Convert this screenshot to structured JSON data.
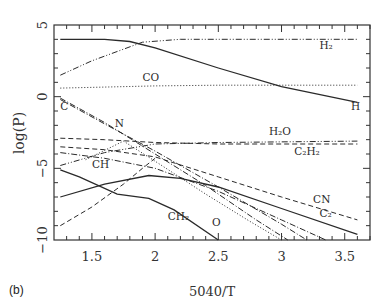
{
  "panel_label": "(b)",
  "chart_data": {
    "type": "line",
    "title": "",
    "xlabel": "5040/T",
    "ylabel": "log(P)",
    "xlim": [
      1.2,
      3.7
    ],
    "ylim": [
      -10,
      5
    ],
    "xticks": [
      1.5,
      2,
      2.5,
      3,
      3.5
    ],
    "xtick_labels": [
      "1.5",
      "2",
      "2.5",
      "3",
      "3.5"
    ],
    "yticks": [
      5,
      0,
      -5,
      -10
    ],
    "ytick_labels": [
      "5",
      "0",
      "−5",
      "−10"
    ],
    "grid": false,
    "legend": "inline labels",
    "series": [
      {
        "name": "H",
        "style": "solid",
        "label_pos": [
          3.55,
          -0.9
        ],
        "x": [
          1.25,
          1.6,
          1.8,
          2.0,
          2.5,
          3.0,
          3.6
        ],
        "y": [
          4.0,
          4.0,
          3.85,
          3.4,
          2.0,
          0.7,
          -0.4
        ]
      },
      {
        "name": "H2",
        "label": "H₂",
        "style": "dashdotdot",
        "label_pos": [
          3.3,
          3.3
        ],
        "x": [
          1.25,
          1.5,
          1.9,
          2.2,
          3.6
        ],
        "y": [
          1.5,
          2.5,
          3.8,
          4.0,
          4.0
        ]
      },
      {
        "name": "CO",
        "style": "dotted",
        "label_pos": [
          1.9,
          1.1
        ],
        "x": [
          1.25,
          2.0,
          2.5,
          3.6
        ],
        "y": [
          0.6,
          0.75,
          0.8,
          0.8
        ]
      },
      {
        "name": "C",
        "style": "dashdot",
        "label_pos": [
          1.25,
          -0.9
        ],
        "x": [
          1.25,
          1.6,
          2.0,
          2.4,
          2.8,
          3.05
        ],
        "y": [
          -0.1,
          -1.8,
          -4.0,
          -6.2,
          -8.6,
          -10.0
        ]
      },
      {
        "name": "N",
        "style": "dashdot",
        "label_pos": [
          1.68,
          -2.1
        ],
        "x": [
          1.25,
          1.6,
          2.0,
          2.5,
          3.0,
          3.2
        ],
        "y": [
          -0.2,
          -1.9,
          -3.8,
          -6.3,
          -8.9,
          -10.0
        ]
      },
      {
        "name": "H2O",
        "label": "H₂O",
        "style": "dashdotdot",
        "label_pos": [
          2.9,
          -2.7
        ],
        "x": [
          1.25,
          1.6,
          2.0,
          2.5,
          3.6
        ],
        "y": [
          -4.8,
          -3.9,
          -3.3,
          -3.2,
          -3.1
        ]
      },
      {
        "name": "C2H2",
        "label": "C₂H₂",
        "style": "dashed",
        "label_pos": [
          3.1,
          -4.1
        ],
        "x": [
          1.25,
          1.6,
          2.0,
          2.5,
          3.6
        ],
        "y": [
          -2.9,
          -3.0,
          -3.2,
          -3.3,
          -3.3
        ]
      },
      {
        "name": "CN",
        "style": "dashed",
        "label_pos": [
          3.25,
          -7.4
        ],
        "x": [
          1.25,
          1.6,
          2.0,
          2.5,
          3.0,
          3.6
        ],
        "y": [
          -3.5,
          -3.7,
          -4.2,
          -5.6,
          -7.0,
          -8.6
        ]
      },
      {
        "name": "CH",
        "style": "dashdot",
        "label_pos": [
          1.5,
          -5.0
        ],
        "x": [
          1.25,
          1.6,
          2.0,
          2.5,
          3.0,
          3.35
        ],
        "y": [
          -3.9,
          -4.3,
          -5.0,
          -6.6,
          -8.6,
          -10.0
        ]
      },
      {
        "name": "CH_rising",
        "style": "dashed",
        "x": [
          1.25,
          1.5,
          1.75,
          1.9,
          2.0
        ],
        "y": [
          -9.0,
          -7.7,
          -6.1,
          -5.0,
          -4.3
        ]
      },
      {
        "name": "O",
        "style": "dotted",
        "label_pos": [
          2.45,
          -9.0
        ],
        "x": [
          1.45,
          1.75,
          2.0,
          2.4,
          2.75,
          3.0
        ],
        "y": [
          -4.4,
          -3.1,
          -4.5,
          -6.8,
          -8.7,
          -10.0
        ]
      },
      {
        "name": "C2",
        "label": "C₂",
        "style": "solid",
        "label_pos": [
          3.3,
          -8.4
        ],
        "x": [
          1.25,
          1.6,
          1.95,
          2.2,
          2.5,
          3.0,
          3.6
        ],
        "y": [
          -7.0,
          -6.1,
          -5.5,
          -5.7,
          -6.3,
          -7.8,
          -9.6
        ]
      },
      {
        "name": "CH2",
        "label": "CH₂",
        "style": "solid",
        "label_pos": [
          2.1,
          -8.6
        ],
        "x": [
          1.25,
          1.4,
          1.7,
          1.95,
          2.15,
          2.5
        ],
        "y": [
          -5.1,
          -5.6,
          -6.8,
          -7.1,
          -7.9,
          -10.0
        ]
      }
    ]
  }
}
